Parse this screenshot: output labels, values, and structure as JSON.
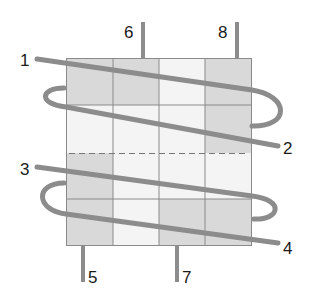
{
  "diagram": {
    "grid": {
      "rows": 4,
      "cols": 4,
      "shaded_cells": [
        [
          0,
          0
        ],
        [
          0,
          1
        ],
        [
          0,
          3
        ],
        [
          1,
          3
        ],
        [
          2,
          0
        ],
        [
          3,
          0
        ],
        [
          3,
          2
        ],
        [
          3,
          3
        ]
      ],
      "dashed_line": "horizontal divider near middle of grid"
    },
    "colors": {
      "shaded_cell": "#d9d9d9",
      "light_cell": "#f4f4f4",
      "grid_line": "#8a8a8a",
      "thread": "#8c8c8c",
      "dashed": "#777777",
      "label": "#1a1a1a"
    },
    "labels": {
      "l1": "1",
      "l2": "2",
      "l3": "3",
      "l4": "4",
      "l5": "5",
      "l6": "6",
      "l7": "7",
      "l8": "8"
    }
  }
}
